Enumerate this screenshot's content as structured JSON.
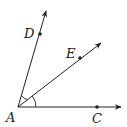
{
  "diagram": {
    "type": "geometry-angles",
    "vertex": {
      "label": "A",
      "x": 18,
      "y": 107,
      "label_x": 6,
      "label_y": 122
    },
    "rays": [
      {
        "name": "AD",
        "end_x": 46,
        "end_y": 11,
        "point": {
          "label": "D",
          "x": 40,
          "y": 34,
          "label_x": 24,
          "label_y": 38
        }
      },
      {
        "name": "AE",
        "end_x": 101,
        "end_y": 43,
        "point": {
          "label": "E",
          "x": 80,
          "y": 58,
          "label_x": 66,
          "label_y": 58
        }
      },
      {
        "name": "AC",
        "end_x": 121,
        "end_y": 107,
        "point": {
          "label": "C",
          "x": 97,
          "y": 107,
          "label_x": 92,
          "label_y": 123
        }
      }
    ],
    "angle_marks": [
      {
        "between": "AD-AE",
        "radius": 12
      },
      {
        "between": "AE-AC",
        "radius": 18
      }
    ],
    "stroke_color": "#222222"
  }
}
